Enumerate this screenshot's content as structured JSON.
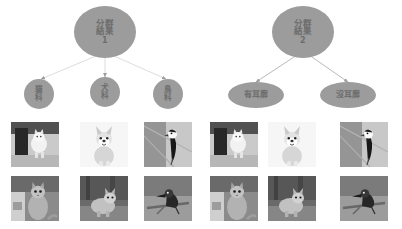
{
  "diagram": {
    "type": "clustering-result-tree",
    "background_color": "#ffffff",
    "node_fill_color": "#9c9c9c",
    "node_text_color": "#6d6d6d",
    "edge_color": "#d2d2d2",
    "tile_placeholder_color": "#b9b9b9"
  },
  "cluster1": {
    "root": {
      "title": "分群\n結果",
      "line1": "分群",
      "line2": "結果",
      "number": "1"
    },
    "children": [
      {
        "line1": "貓",
        "line2": "科",
        "label": "貓科"
      },
      {
        "line1": "犬",
        "line2": "科",
        "label": "犬科"
      },
      {
        "line1": "鳥",
        "line2": "科",
        "label": "鳥科"
      }
    ],
    "image_groups": [
      {
        "category": "貓科",
        "images": [
          "cat-standing-doorway",
          "cat-sitting-indoor"
        ]
      },
      {
        "category": "犬科",
        "images": [
          "corgi-sitting-white",
          "corgi-outdoor-grass"
        ]
      },
      {
        "category": "鳥科",
        "images": [
          "bird-perched-branch",
          "kingfisher-on-branch"
        ]
      }
    ]
  },
  "cluster2": {
    "root": {
      "line1": "分群",
      "line2": "結果",
      "number": "2"
    },
    "children": [
      {
        "label": "有耳廓"
      },
      {
        "label": "沒耳廓"
      }
    ],
    "image_groups": [
      {
        "category": "有耳廓",
        "images": [
          "cat-standing-doorway",
          "corgi-sitting-white",
          "cat-sitting-indoor",
          "corgi-outdoor-grass"
        ]
      },
      {
        "category": "沒耳廓",
        "images": [
          "bird-perched-branch",
          "kingfisher-on-branch"
        ]
      }
    ]
  }
}
